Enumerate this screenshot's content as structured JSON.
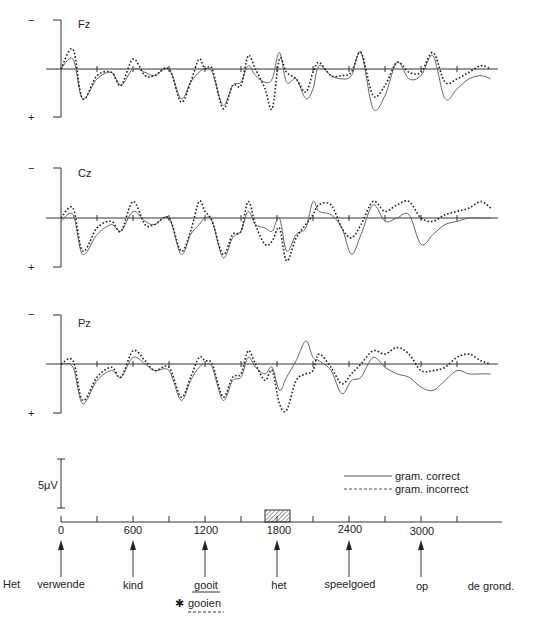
{
  "chart_data": {
    "type": "line",
    "title": "",
    "xlabel": "time (ms)",
    "ylabel": "",
    "x_ticks": [
      0,
      600,
      1200,
      1800,
      2400,
      3000
    ],
    "x_range": [
      0,
      3600
    ],
    "y_polarity": {
      "top": "−",
      "bottom": "+"
    },
    "scale_bar": "5μV",
    "legend": [
      {
        "name": "gram. correct",
        "style": "solid"
      },
      {
        "name": "gram. incorrect",
        "style": "dashed"
      }
    ],
    "highlight_window": {
      "start_ms": 1750,
      "end_ms": 1920,
      "style": "hatched"
    },
    "panels": [
      {
        "name": "Fz",
        "x": [
          0,
          100,
          180,
          300,
          420,
          500,
          600,
          700,
          780,
          900,
          1000,
          1080,
          1150,
          1200,
          1260,
          1350,
          1430,
          1500,
          1560,
          1620,
          1700,
          1760,
          1820,
          1880,
          1960,
          2040,
          2100,
          2150,
          2250,
          2340,
          2420,
          2500,
          2600,
          2700,
          2800,
          2900,
          3000,
          3100,
          3200,
          3300,
          3400,
          3500,
          3580
        ],
        "series": [
          {
            "name": "gram. correct",
            "values": [
              0,
              3,
              -9,
              -3,
              -1,
              -5,
              0,
              -1,
              -2,
              0,
              -9,
              -4,
              -1,
              0,
              -1,
              -11,
              -5,
              -4,
              1,
              -2,
              -4,
              -3,
              5,
              -4,
              -3,
              -9,
              -6,
              1,
              -2,
              -3,
              -2,
              5,
              -12,
              -8,
              2,
              -3,
              -2,
              4,
              -9,
              -6,
              -3,
              -2,
              -3
            ]
          },
          {
            "name": "gram. incorrect",
            "values": [
              0,
              6,
              -9,
              -2,
              -1,
              -5,
              3,
              -2,
              -2,
              0,
              -10,
              -4,
              3,
              0,
              0,
              -12,
              -5,
              -5,
              4,
              0,
              -6,
              -12,
              3,
              -1,
              -3,
              -7,
              -1,
              2,
              -2,
              -2,
              -1,
              5,
              -8,
              -5,
              2,
              -1,
              -1,
              5,
              -4,
              -3,
              -1,
              1,
              0
            ]
          }
        ]
      },
      {
        "name": "Cz",
        "x": [
          0,
          100,
          180,
          300,
          420,
          500,
          600,
          700,
          780,
          900,
          1000,
          1080,
          1150,
          1200,
          1260,
          1350,
          1430,
          1500,
          1560,
          1620,
          1700,
          1760,
          1820,
          1880,
          1960,
          2040,
          2100,
          2150,
          2250,
          2340,
          2420,
          2500,
          2600,
          2700,
          2800,
          2900,
          3000,
          3100,
          3200,
          3300,
          3400,
          3500,
          3580
        ],
        "series": [
          {
            "name": "gram. correct",
            "values": [
              -1,
              1,
              -11,
              -5,
              -2,
              -4,
              2,
              -1,
              -2,
              0,
              -11,
              -5,
              -2,
              0,
              -1,
              -12,
              -6,
              -4,
              2,
              -2,
              -3,
              -4,
              0,
              -10,
              -5,
              -3,
              5,
              2,
              1,
              -3,
              -11,
              -5,
              4,
              -1,
              0,
              1,
              -8,
              -5,
              -2,
              -1,
              0,
              0,
              0
            ]
          },
          {
            "name": "gram. incorrect",
            "values": [
              0,
              3,
              -10,
              -3,
              -1,
              -4,
              5,
              -2,
              -2,
              0,
              -10,
              -4,
              5,
              2,
              -1,
              -11,
              -5,
              -4,
              5,
              -2,
              -8,
              -7,
              -3,
              -13,
              -6,
              -2,
              1,
              4,
              4,
              -3,
              -6,
              -2,
              5,
              2,
              4,
              5,
              0,
              -1,
              1,
              2,
              3,
              5,
              3
            ]
          }
        ]
      },
      {
        "name": "Pz",
        "x": [
          0,
          100,
          180,
          300,
          420,
          500,
          600,
          700,
          780,
          900,
          1000,
          1080,
          1150,
          1200,
          1260,
          1350,
          1430,
          1500,
          1560,
          1620,
          1700,
          1760,
          1820,
          1880,
          1960,
          2040,
          2100,
          2150,
          2250,
          2340,
          2420,
          2500,
          2600,
          2700,
          2800,
          2900,
          3000,
          3100,
          3200,
          3300,
          3400,
          3500,
          3580
        ],
        "series": [
          {
            "name": "gram. correct",
            "values": [
              0,
              -1,
              -12,
              -5,
              -2,
              -4,
              2,
              0,
              -2,
              -2,
              -11,
              -5,
              -1,
              0,
              -1,
              -11,
              -5,
              -4,
              2,
              -1,
              -3,
              -1,
              -8,
              -4,
              1,
              7,
              2,
              1,
              -2,
              -9,
              -5,
              -4,
              2,
              -1,
              -3,
              -4,
              -7,
              -8,
              -5,
              -2,
              -3,
              -3,
              -3
            ]
          },
          {
            "name": "gram. incorrect",
            "values": [
              0,
              1,
              -11,
              -4,
              -1,
              -4,
              4,
              1,
              -2,
              -1,
              -10,
              -4,
              2,
              1,
              0,
              -10,
              -4,
              -3,
              4,
              0,
              -5,
              -2,
              -12,
              -14,
              -5,
              -3,
              -2,
              3,
              -1,
              -6,
              -3,
              0,
              4,
              3,
              5,
              3,
              -2,
              -2,
              -1,
              2,
              3,
              1,
              0
            ]
          }
        ]
      }
    ],
    "words": [
      {
        "text": "Het",
        "ms": null,
        "arrow": false
      },
      {
        "text": "verwende",
        "ms": 0,
        "arrow": true
      },
      {
        "text": "kind",
        "ms": 600,
        "arrow": true
      },
      {
        "text": "gooit",
        "ms": 1200,
        "arrow": true,
        "underline": "solid",
        "alt": "gooien",
        "alt_marker": "✱",
        "alt_underline": "dashed"
      },
      {
        "text": "het",
        "ms": 1800,
        "arrow": true
      },
      {
        "text": "speelgoed",
        "ms": 2400,
        "arrow": true
      },
      {
        "text": "op",
        "ms": 3000,
        "arrow": true
      },
      {
        "text": "de grond.",
        "ms": null,
        "arrow": false
      }
    ]
  },
  "labels": {
    "minus": "−",
    "plus": "+",
    "scale": "5μV",
    "legend_correct": "gram. correct",
    "legend_incorrect": "gram. incorrect",
    "ticks": [
      "0",
      "600",
      "1200",
      "1800",
      "2400",
      "3000"
    ],
    "word_het": "Het",
    "word_verwende": "verwende",
    "word_kind": "kind",
    "word_gooit": "gooit",
    "word_gooien": "gooien",
    "word_star": "✱",
    "word_het2": "het",
    "word_speelgoed": "speelgoed",
    "word_op": "op",
    "word_degrond": "de grond.",
    "panel_fz": "Fz",
    "panel_cz": "Cz",
    "panel_pz": "Pz"
  }
}
